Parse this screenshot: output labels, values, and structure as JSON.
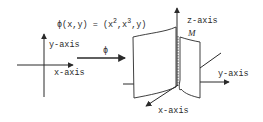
{
  "diagram": {
    "formula": {
      "prefix": "ϕ(x,y) = (x",
      "exp1": "2",
      "mid": ",x",
      "exp2": "3",
      "suffix": ",y)"
    },
    "map_label": "ϕ",
    "plane_2d": {
      "y_axis_label": "y-axis",
      "x_axis_label": "x-axis"
    },
    "space_3d": {
      "z_axis_label": "z-axis",
      "y_axis_label": "y-axis",
      "x_axis_label": "x-axis",
      "surface_label": "M"
    },
    "colors": {
      "ink": "#2a2a2a",
      "background": "#ffffff"
    }
  }
}
